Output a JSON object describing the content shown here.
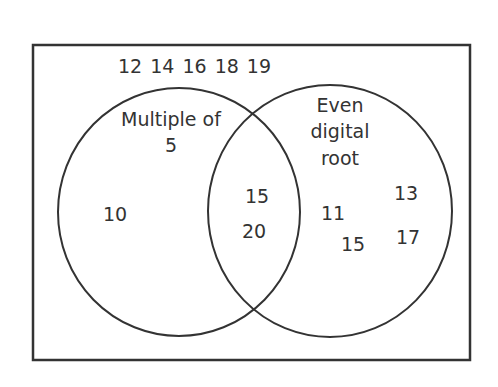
{
  "venn": {
    "outside": "12 14 16 18 19",
    "set_a": {
      "label_line1": "Multiple of",
      "label_line2": "5",
      "only": [
        "10"
      ]
    },
    "set_b": {
      "label_line1": "Even",
      "label_line2": "digital",
      "label_line3": "root",
      "only": [
        "11",
        "15",
        "13",
        "17"
      ]
    },
    "intersection": [
      "15",
      "20"
    ]
  },
  "colors": {
    "stroke": "#333333",
    "text": "#333333",
    "background": "#ffffff"
  }
}
